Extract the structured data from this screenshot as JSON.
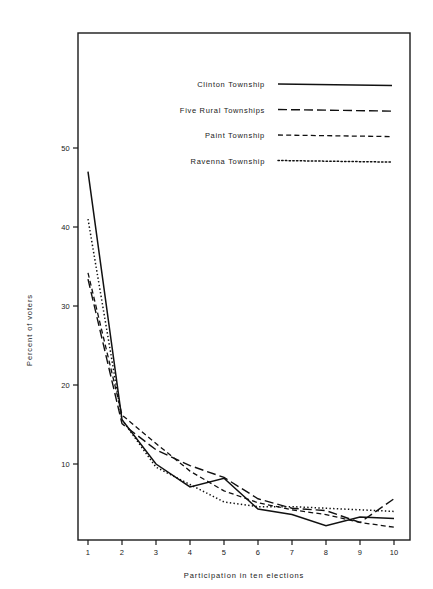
{
  "page_header": {
    "center": "",
    "right": ""
  },
  "chart_data": {
    "type": "line",
    "title": "",
    "xlabel": "Participation in ten elections",
    "ylabel": "Percent of voters",
    "x": [
      1,
      2,
      3,
      4,
      5,
      6,
      7,
      8,
      9,
      10
    ],
    "xtick_labels": [
      "1",
      "2",
      "3",
      "4",
      "5",
      "6",
      "7",
      "8",
      "9",
      "10"
    ],
    "ytick_labels": [
      "10",
      "20",
      "30",
      "40",
      "50"
    ],
    "yticks": [
      10,
      20,
      30,
      40,
      50
    ],
    "xlim": [
      0.4,
      10.6
    ],
    "ylim": [
      0,
      58
    ],
    "grid": false,
    "legend_position": "upper-right-inside",
    "series": [
      {
        "name": "Clinton Township",
        "dash": "solid",
        "values": [
          47.0,
          15.6,
          10.0,
          7.1,
          8.2,
          4.3,
          3.6,
          2.2,
          3.3,
          3.1
        ]
      },
      {
        "name": "Five Rural Townships",
        "dash": "long-dash",
        "values": [
          33.4,
          15.1,
          11.8,
          9.8,
          8.3,
          5.6,
          4.4,
          4.1,
          2.6,
          5.6
        ]
      },
      {
        "name": "Paint Township",
        "dash": "medium-dash",
        "values": [
          34.2,
          16.2,
          12.6,
          9.1,
          6.6,
          5.1,
          4.2,
          3.6,
          2.6,
          2.0
        ]
      },
      {
        "name": "Ravenna Township",
        "dash": "dotted",
        "values": [
          41.0,
          15.6,
          9.6,
          7.4,
          5.2,
          4.6,
          4.6,
          4.4,
          4.2,
          4.0
        ]
      }
    ]
  }
}
